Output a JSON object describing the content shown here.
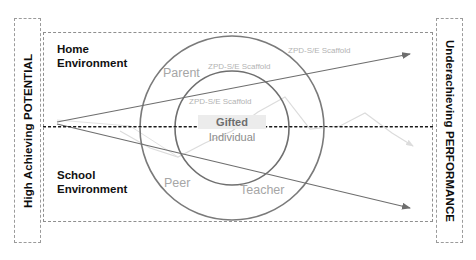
{
  "diagram": {
    "title_left": "High Achieving POTENTIAL",
    "title_right": "Underachieving PERFORMANCE",
    "environments": [
      {
        "key": "home",
        "label": "Home\nEnvironment"
      },
      {
        "key": "school",
        "label": "School\nEnvironment"
      }
    ],
    "rings": [
      {
        "key": "outer",
        "label": "Parent"
      },
      {
        "key": "outer2",
        "label": "Peer"
      },
      {
        "key": "outer3",
        "label": "Teacher"
      }
    ],
    "scaffold_labels": {
      "outer": "ZPD-S/E Scaffold",
      "middle": "ZPD-S/E Scaffold",
      "inner": "ZPD-S/E Scaffold"
    },
    "center": {
      "line1": "Gifted",
      "line2": "Individual"
    },
    "colors": {
      "circle_stroke": "#7a7a7a",
      "arrow_stroke": "#6e6e6e",
      "faint_line": "#d2d2d2",
      "dash_border": "#9b9b9b",
      "divider": "#1a1a1a",
      "label_gray": "#a6a6a6",
      "center_highlight": "#ececec",
      "text_dark": "#111111"
    }
  }
}
